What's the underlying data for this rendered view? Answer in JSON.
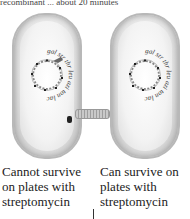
{
  "header": {
    "partial_text": "recombinant ... about 20 minutes"
  },
  "cells": [
    {
      "id": "donor",
      "genes": [
        "gal",
        "str",
        "thr",
        "leu",
        "azi",
        "ton",
        "lac"
      ],
      "gene_superscripts": [
        "r",
        "r",
        "r",
        "r",
        "r",
        "r",
        "r"
      ],
      "has_pilus": true,
      "caption_lines": [
        "Cannot survive",
        "on plates with",
        "streptomycin"
      ]
    },
    {
      "id": "recipient",
      "genes": [
        "gal",
        "str",
        "thr",
        "leu",
        "azi",
        "ton",
        "lac"
      ],
      "gene_superscripts": [
        "r",
        "r",
        "r",
        "r",
        "r",
        "r",
        "r"
      ],
      "has_pilus": false,
      "caption_lines": [
        "Can survive on",
        "plates with",
        "streptomycin"
      ]
    }
  ],
  "colors": {
    "cell_outline": "#b8b8b8",
    "pilus": "#a8a8a8",
    "text": "#222222"
  }
}
